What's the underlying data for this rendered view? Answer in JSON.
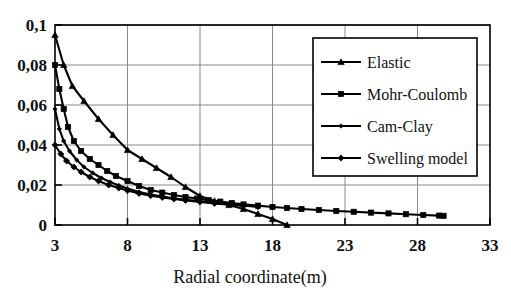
{
  "chart_data": {
    "type": "line",
    "title": "",
    "xlabel": "Radial coordinate(m)",
    "ylabel": "",
    "xlim": [
      3,
      33
    ],
    "ylim": [
      0,
      0.1
    ],
    "xticks": [
      "3",
      "8",
      "13",
      "18",
      "23",
      "28",
      "33"
    ],
    "yticks": [
      "0",
      "0,02",
      "0,04",
      "0,06",
      "0,08",
      "0,1"
    ],
    "xtick_values": [
      3,
      8,
      13,
      18,
      23,
      28,
      33
    ],
    "ytick_values": [
      0,
      0.02,
      0.04,
      0.06,
      0.08,
      0.1
    ],
    "grid": true,
    "decimal_separator": ",",
    "legend_position": "upper-right",
    "line_color": "#000000",
    "grid_color": "#8a8a8a",
    "series": [
      {
        "name": "Elastic",
        "marker": "triangle",
        "x": [
          3,
          3.6,
          4.2,
          5.0,
          6.0,
          7.0,
          8.0,
          9.0,
          10.0,
          11.0,
          12.0,
          13.0,
          14.0,
          15.0,
          16.0,
          17.0,
          18.0,
          19.0
        ],
        "y": [
          0.095,
          0.08,
          0.0695,
          0.062,
          0.053,
          0.045,
          0.0375,
          0.033,
          0.0285,
          0.024,
          0.019,
          0.0145,
          0.012,
          0.01,
          0.008,
          0.0055,
          0.003,
          0.0
        ]
      },
      {
        "name": "Mohr-Coulomb",
        "marker": "square",
        "x": [
          3,
          3.3,
          3.6,
          3.9,
          4.3,
          4.8,
          5.4,
          6.0,
          6.6,
          7.2,
          8.0,
          8.8,
          9.6,
          10.4,
          11.2,
          12.0,
          12.8,
          13.6,
          14.4,
          15.2,
          16.0,
          17.0,
          18.0,
          19.0,
          20.0,
          21.2,
          22.4,
          23.6,
          24.8,
          26.0,
          27.2,
          28.4,
          29.5,
          29.8
        ],
        "y": [
          0.08,
          0.068,
          0.058,
          0.049,
          0.042,
          0.037,
          0.033,
          0.03,
          0.027,
          0.0245,
          0.022,
          0.0195,
          0.0175,
          0.0162,
          0.015,
          0.014,
          0.0132,
          0.0124,
          0.0117,
          0.011,
          0.0103,
          0.0097,
          0.009,
          0.0085,
          0.008,
          0.0075,
          0.007,
          0.0066,
          0.0062,
          0.0058,
          0.0054,
          0.005,
          0.0047,
          0.0046
        ]
      },
      {
        "name": "Cam-Clay",
        "marker": "small-diamond",
        "x": [
          3,
          3.3,
          3.6,
          4.0,
          4.5,
          5.0,
          5.6,
          6.2,
          6.8,
          7.4,
          8.0,
          8.8,
          9.6,
          10.4,
          11.2,
          12.0,
          13.0,
          14.0,
          15.0,
          16.0,
          17.0
        ],
        "y": [
          0.058,
          0.048,
          0.042,
          0.037,
          0.0325,
          0.029,
          0.026,
          0.0235,
          0.0215,
          0.0198,
          0.0182,
          0.0165,
          0.0152,
          0.0142,
          0.0133,
          0.0126,
          0.0118,
          0.011,
          0.0104,
          0.0098,
          0.0093
        ]
      },
      {
        "name": "Swelling model",
        "marker": "diamond",
        "x": [
          3,
          3.4,
          3.8,
          4.3,
          4.8,
          5.4,
          6.0,
          6.7,
          7.4,
          8.0,
          8.8,
          9.6,
          10.4,
          11.2,
          12.0,
          13.0,
          14.0,
          15.0,
          16.0,
          17.0
        ],
        "y": [
          0.04,
          0.0355,
          0.032,
          0.029,
          0.0265,
          0.024,
          0.022,
          0.02,
          0.0185,
          0.0172,
          0.0158,
          0.0147,
          0.0138,
          0.013,
          0.0123,
          0.0115,
          0.0108,
          0.0102,
          0.0097,
          0.0092
        ]
      }
    ]
  },
  "legend": {
    "items": [
      {
        "label": "Elastic",
        "marker": "triangle"
      },
      {
        "label": "Mohr-Coulomb",
        "marker": "square"
      },
      {
        "label": "Cam-Clay",
        "marker": "small-diamond"
      },
      {
        "label": "Swelling model",
        "marker": "diamond"
      }
    ]
  },
  "axis": {
    "x_title": "Radial coordinate(m)"
  }
}
